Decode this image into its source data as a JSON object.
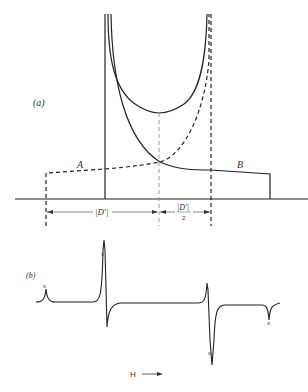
{
  "figure": {
    "panel_a": {
      "label": "(a)",
      "region_left_label": "A",
      "region_right_label": "B",
      "dimension_left_label": "|D'|",
      "dimension_right_label_num": "|D'|",
      "dimension_right_label_den": "2"
    },
    "panel_b": {
      "label": "(b)",
      "axis_label": "H",
      "marker_symbol": "x"
    },
    "colors": {
      "line": "#222222",
      "guide": "#888888"
    }
  }
}
